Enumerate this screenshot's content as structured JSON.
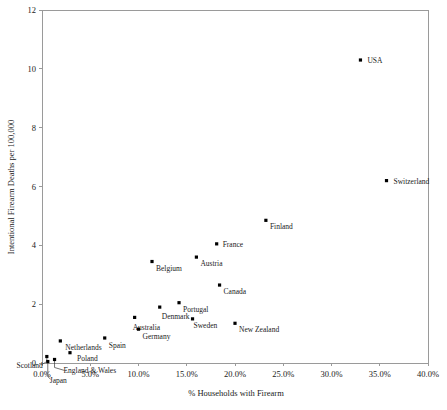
{
  "chart_data": {
    "type": "scatter",
    "title": "",
    "xlabel": "% Households with Firearm",
    "ylabel": "Intentional Firearm Deaths per 100,000",
    "xlim": [
      0,
      40
    ],
    "ylim": [
      0,
      12
    ],
    "x_ticks": [
      "0.0%",
      "5.0%",
      "10.0%",
      "15.0%",
      "20.0%",
      "25.0%",
      "30.0%",
      "35.0%",
      "40.0%"
    ],
    "x_tick_values": [
      0,
      5,
      10,
      15,
      20,
      25,
      30,
      35,
      40
    ],
    "y_ticks": [
      "0",
      "2",
      "4",
      "6",
      "8",
      "10",
      "12"
    ],
    "y_tick_values": [
      0,
      2,
      4,
      6,
      8,
      10,
      12
    ],
    "grid": false,
    "legend": "none",
    "points": [
      {
        "label": "USA",
        "x": 33.0,
        "y": 10.3,
        "label_dx": 7,
        "label_dy": 2.5,
        "anchor": "start",
        "leader": false
      },
      {
        "label": "Switzerland",
        "x": 35.7,
        "y": 6.2,
        "label_dx": 7,
        "label_dy": 3.5,
        "anchor": "start",
        "leader": false
      },
      {
        "label": "Finland",
        "x": 23.2,
        "y": 4.85,
        "label_dx": 4,
        "label_dy": 9,
        "anchor": "start",
        "leader": false
      },
      {
        "label": "France",
        "x": 18.1,
        "y": 4.05,
        "label_dx": 6,
        "label_dy": 3,
        "anchor": "start",
        "leader": false
      },
      {
        "label": "Austria",
        "x": 16.0,
        "y": 3.6,
        "label_dx": 4,
        "label_dy": 9,
        "anchor": "start",
        "leader": false
      },
      {
        "label": "Canada",
        "x": 18.4,
        "y": 2.65,
        "label_dx": 4,
        "label_dy": 9,
        "anchor": "start",
        "leader": false
      },
      {
        "label": "Belgium",
        "x": 11.4,
        "y": 3.45,
        "label_dx": 4,
        "label_dy": 9,
        "anchor": "start",
        "leader": false
      },
      {
        "label": "Portugal",
        "x": 14.2,
        "y": 2.05,
        "label_dx": 4,
        "label_dy": 9,
        "anchor": "start",
        "leader": false
      },
      {
        "label": "Sweden",
        "x": 15.6,
        "y": 1.5,
        "label_dx": 1,
        "label_dy": 9,
        "anchor": "start",
        "leader": false
      },
      {
        "label": "New Zealand",
        "x": 20.0,
        "y": 1.35,
        "label_dx": 4,
        "label_dy": 9,
        "anchor": "start",
        "leader": false
      },
      {
        "label": "Denmark",
        "x": 12.2,
        "y": 1.9,
        "label_dx": 2,
        "label_dy": 12,
        "anchor": "start",
        "leader": false
      },
      {
        "label": "Australia",
        "x": 9.6,
        "y": 1.55,
        "label_dx": -2,
        "label_dy": 13,
        "anchor": "start",
        "leader": false
      },
      {
        "label": "Germany",
        "x": 10.0,
        "y": 1.15,
        "label_dx": 4,
        "label_dy": 10,
        "anchor": "start",
        "leader": false
      },
      {
        "label": "Spain",
        "x": 6.5,
        "y": 0.85,
        "label_dx": 4,
        "label_dy": 10,
        "anchor": "start",
        "leader": false
      },
      {
        "label": "Netherlands",
        "x": 1.9,
        "y": 0.75,
        "label_dx": 5,
        "label_dy": 9,
        "anchor": "start",
        "leader": false
      },
      {
        "label": "Poland",
        "x": 2.9,
        "y": 0.35,
        "label_dx": 7,
        "label_dy": 8,
        "anchor": "start",
        "leader": false
      },
      {
        "label": "Scotland",
        "x": 0.5,
        "y": 0.22,
        "label_dx": -4,
        "label_dy": 11,
        "anchor": "end",
        "leader": true
      },
      {
        "label": "England & Wales",
        "x": 1.3,
        "y": 0.12,
        "label_dx": 9,
        "label_dy": 14,
        "anchor": "start",
        "leader": true
      },
      {
        "label": "Japan",
        "x": 0.6,
        "y": 0.05,
        "label_dx": 2,
        "label_dy": 21,
        "anchor": "start",
        "leader": true
      }
    ]
  }
}
